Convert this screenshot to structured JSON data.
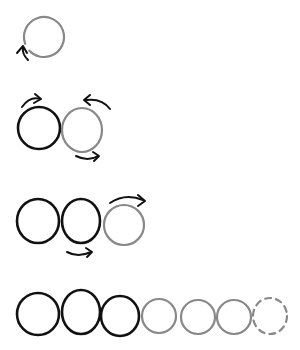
{
  "colors": {
    "dark": "#111111",
    "light": "#888888",
    "background": "#ffffff"
  },
  "rows": [
    {
      "name": "row-1",
      "circles": [
        {
          "cx": 44,
          "cy": 37,
          "rx": 20,
          "ry": 20,
          "tone": "light",
          "style": "open-gap"
        }
      ],
      "arrows": [
        {
          "d": "M 28 60 Q 22 54 23 48",
          "head": "M 17 53 L 23 46 L 27 53",
          "name": "counterclockwise-arrow-icon"
        }
      ]
    },
    {
      "name": "row-2",
      "circles": [
        {
          "cx": 39,
          "cy": 128,
          "rx": 21,
          "ry": 21,
          "tone": "dark",
          "style": "solid"
        },
        {
          "cx": 82,
          "cy": 130,
          "rx": 20,
          "ry": 22,
          "tone": "light",
          "style": "solid"
        }
      ],
      "arrows": [
        {
          "d": "M 22 107 Q 30 96 40 99",
          "head": "M 35 94 L 41 99 L 34 103",
          "name": "right-arrow-top-icon"
        },
        {
          "d": "M 110 109 Q 102 98 86 100",
          "head": "M 90 95 L 84 100 L 90 105",
          "name": "left-arrow-top-icon"
        },
        {
          "d": "M 76 156 Q 88 162 98 156",
          "head": "M 93 152 L 99 156 L 94 161",
          "name": "right-arrow-bottom-icon"
        }
      ]
    },
    {
      "name": "row-3",
      "circles": [
        {
          "cx": 38,
          "cy": 221,
          "rx": 21,
          "ry": 22,
          "tone": "dark",
          "style": "solid"
        },
        {
          "cx": 81,
          "cy": 221,
          "rx": 19,
          "ry": 22,
          "tone": "dark",
          "style": "solid"
        },
        {
          "cx": 124,
          "cy": 225,
          "rx": 20,
          "ry": 20,
          "tone": "light",
          "style": "solid"
        }
      ],
      "arrows": [
        {
          "d": "M 110 203 Q 125 193 143 200",
          "head": "M 138 195 L 145 201 L 138 206",
          "name": "right-arrow-top-icon"
        },
        {
          "d": "M 67 252 Q 78 258 91 252",
          "head": "M 86 248 L 92 252 L 87 257",
          "name": "right-arrow-bottom-icon"
        }
      ]
    },
    {
      "name": "row-4",
      "circles": [
        {
          "cx": 38,
          "cy": 314,
          "rx": 21,
          "ry": 21,
          "tone": "dark",
          "style": "solid"
        },
        {
          "cx": 81,
          "cy": 312,
          "rx": 19,
          "ry": 22,
          "tone": "dark",
          "style": "solid"
        },
        {
          "cx": 120,
          "cy": 316,
          "rx": 19,
          "ry": 20,
          "tone": "dark",
          "style": "solid"
        },
        {
          "cx": 159,
          "cy": 316,
          "rx": 17,
          "ry": 17,
          "tone": "light",
          "style": "solid"
        },
        {
          "cx": 198,
          "cy": 317,
          "rx": 17,
          "ry": 17,
          "tone": "light",
          "style": "solid"
        },
        {
          "cx": 234,
          "cy": 317,
          "rx": 17,
          "ry": 17,
          "tone": "light",
          "style": "solid"
        },
        {
          "cx": 270,
          "cy": 316,
          "rx": 17,
          "ry": 18,
          "tone": "light",
          "style": "dashed"
        }
      ],
      "arrows": []
    }
  ]
}
